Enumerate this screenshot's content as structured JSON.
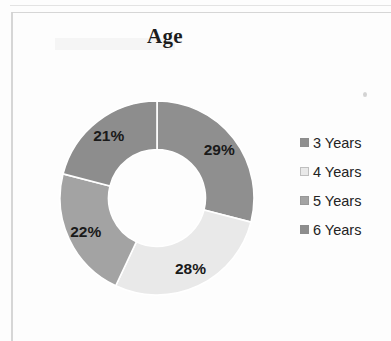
{
  "page": {
    "background_color": "#fdfdfd",
    "frame_color": "#d2d2d2"
  },
  "chart_data": {
    "type": "pie",
    "variant": "doughnut",
    "title": "Age",
    "xlabel": "",
    "ylabel": "",
    "legend_position": "right",
    "grid": false,
    "start_angle_deg": 0,
    "direction": "clockwise",
    "inner_radius_ratio": 0.5,
    "categories": [
      "3 Years",
      "4 Years",
      "5 Years",
      "6 Years"
    ],
    "values": [
      29,
      28,
      22,
      21
    ],
    "value_labels": [
      "29%",
      "28%",
      "22%",
      "21%"
    ],
    "colors": [
      "#8f8f8f",
      "#e9e9e9",
      "#a3a3a3",
      "#8d8d8d"
    ],
    "slices": [
      {
        "label": "3 Years",
        "value": 29,
        "value_label": "29%",
        "color": "#8f8f8f"
      },
      {
        "label": "4 Years",
        "value": 28,
        "value_label": "28%",
        "color": "#e9e9e9"
      },
      {
        "label": "5 Years",
        "value": 22,
        "value_label": "22%",
        "color": "#a3a3a3"
      },
      {
        "label": "6 Years",
        "value": 21,
        "value_label": "21%",
        "color": "#8d8d8d"
      }
    ]
  },
  "legend": {
    "items": [
      {
        "label": "3 Years",
        "color": "#8f8f8f",
        "swatch_icon": "legend-swatch-icon"
      },
      {
        "label": "4 Years",
        "color": "#e9e9e9",
        "swatch_icon": "legend-swatch-icon"
      },
      {
        "label": "5 Years",
        "color": "#a3a3a3",
        "swatch_icon": "legend-swatch-icon"
      },
      {
        "label": "6 Years",
        "color": "#8d8d8d",
        "swatch_icon": "legend-swatch-icon"
      }
    ]
  }
}
